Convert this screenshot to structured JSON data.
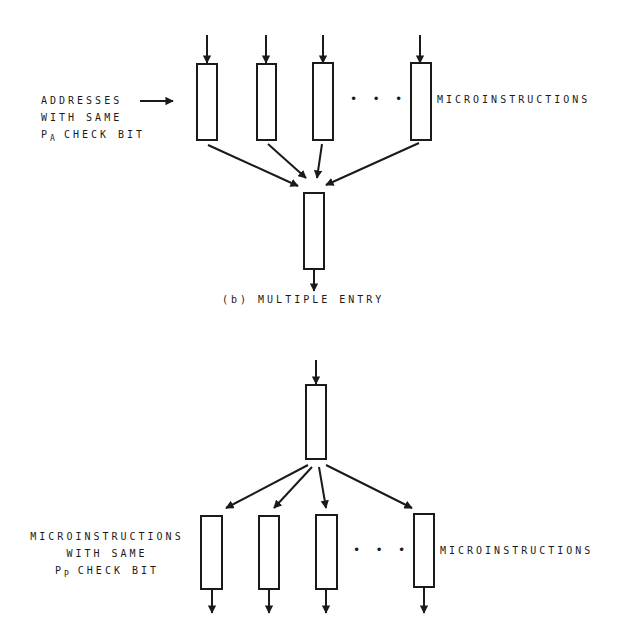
{
  "diagram": {
    "top": {
      "left_label": {
        "line1": "ADDRESSES",
        "line2": "WITH SAME",
        "line3_prefix": "P",
        "line3_sub": "A",
        "line3_rest": " CHECK BIT"
      },
      "right_label": "MICROINSTRUCTIONS",
      "ellipsis": "• • •",
      "caption": "(b) MULTIPLE ENTRY"
    },
    "bottom": {
      "left_label": {
        "line1": "MICROINSTRUCTIONS",
        "line2": "WITH SAME",
        "line3_prefix": "P",
        "line3_sub": "P",
        "line3_rest": " CHECK BIT"
      },
      "right_label": "MICROINSTRUCTIONS",
      "ellipsis": "• • •"
    },
    "colors": {
      "ink": "#1a1a1a",
      "background": "#ffffff"
    }
  }
}
